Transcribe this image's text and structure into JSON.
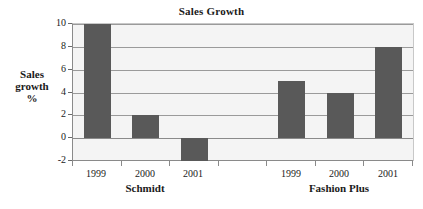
{
  "chart_data": {
    "type": "bar",
    "title": "Sales Growth",
    "xlabel": "",
    "ylabel": "Sales growth %",
    "ylabel_lines": [
      "Sales",
      "growth",
      "%"
    ],
    "ylim": [
      -2,
      10
    ],
    "ytick_values": [
      10,
      8,
      6,
      4,
      2,
      0,
      -2
    ],
    "ytick_labels": [
      "10",
      "8",
      "6",
      "4",
      "2",
      "0",
      "-2"
    ],
    "grid": true,
    "legend": false,
    "bar_color": "#595959",
    "plot_background": "#f4f4f4",
    "gridline_color": "#9a9a9a",
    "categories": [
      "1999",
      "2000",
      "2001",
      "",
      "1999",
      "2000",
      "2001"
    ],
    "values": [
      10,
      2,
      -2,
      null,
      5,
      4,
      8
    ],
    "groups": [
      {
        "label": "Schmidt",
        "categories": [
          "1999",
          "2000",
          "2001"
        ],
        "values": [
          10,
          2,
          -2
        ]
      },
      {
        "label": "Fashion Plus",
        "categories": [
          "1999",
          "2000",
          "2001"
        ],
        "values": [
          5,
          4,
          8
        ]
      }
    ],
    "series": [
      {
        "name": "Sales growth %",
        "values": [
          10,
          2,
          -2,
          null,
          5,
          4,
          8
        ]
      }
    ]
  }
}
